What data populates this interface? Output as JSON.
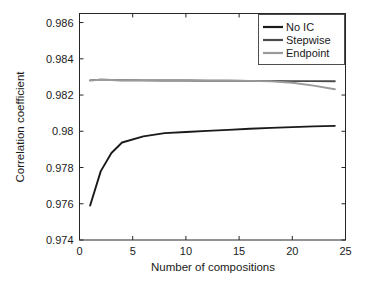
{
  "chart_data": {
    "type": "line",
    "title": "",
    "xlabel": "Number of compositions",
    "ylabel": "Correlation coefficient",
    "xlim": [
      0,
      25
    ],
    "ylim": [
      0.974,
      0.9865
    ],
    "xticks": [
      0,
      5,
      10,
      15,
      20,
      25
    ],
    "xtick_labels": [
      "0",
      "5",
      "10",
      "15",
      "20",
      "25"
    ],
    "yticks": [
      0.974,
      0.976,
      0.978,
      0.98,
      0.982,
      0.984,
      0.986
    ],
    "ytick_labels": [
      "0.974",
      "0.976",
      "0.978",
      "0.98",
      "0.982",
      "0.984",
      "0.986"
    ],
    "grid": false,
    "legend_position": "upper right",
    "series": [
      {
        "name": "No IC",
        "color": "#1a1a1a",
        "x": [
          1,
          2,
          3,
          4,
          6,
          8,
          10,
          12,
          14,
          16,
          18,
          20,
          22,
          24
        ],
        "values": [
          0.9759,
          0.9778,
          0.9788,
          0.97938,
          0.97972,
          0.9799,
          0.97996,
          0.98002,
          0.98008,
          0.98014,
          0.98019,
          0.98023,
          0.98027,
          0.9803
        ]
      },
      {
        "name": "Stepwise",
        "color": "#4a4a4a",
        "x": [
          1,
          2,
          3,
          4,
          6,
          8,
          10,
          12,
          14,
          16,
          18,
          20,
          22,
          24
        ],
        "values": [
          0.98281,
          0.98284,
          0.98283,
          0.98282,
          0.98281,
          0.9828,
          0.9828,
          0.98279,
          0.98279,
          0.98278,
          0.98278,
          0.98277,
          0.98277,
          0.98276
        ]
      },
      {
        "name": "Endpoint",
        "color": "#9a9a9a",
        "x": [
          1,
          2,
          3,
          4,
          6,
          8,
          10,
          12,
          14,
          16,
          18,
          20,
          22,
          24
        ],
        "values": [
          0.98281,
          0.98284,
          0.98283,
          0.98282,
          0.98281,
          0.9828,
          0.9828,
          0.98279,
          0.98279,
          0.98278,
          0.98276,
          0.98268,
          0.98252,
          0.98232
        ]
      }
    ]
  },
  "legend": {
    "items": [
      {
        "label": "No IC"
      },
      {
        "label": "Stepwise"
      },
      {
        "label": "Endpoint"
      }
    ]
  }
}
